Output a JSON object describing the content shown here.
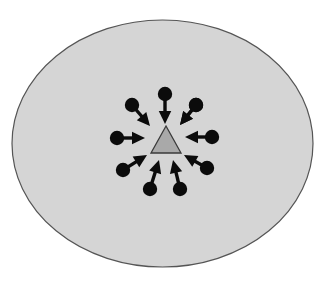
{
  "figure": {
    "background_color": "#ffffff",
    "width": 326,
    "height": 282
  },
  "ellipse": {
    "label": "enclosing-region",
    "cx": 162.5,
    "cy": 143.5,
    "rx": 150.5,
    "ry": 123.5,
    "fill": "#d5d5d5",
    "stroke": "#555555",
    "stroke_width": 1.2
  },
  "triangle": {
    "label": "center-target",
    "apex_x": 166,
    "apex_y": 126,
    "left_x": 151,
    "left_y": 153,
    "right_x": 181,
    "right_y": 153,
    "fill": "#a9a9a9",
    "stroke": "#3a3a3a",
    "stroke_width": 1.3
  },
  "arrows": {
    "count": 10,
    "color": "#0b0b0b",
    "dot_radius": 7.2,
    "shaft_width": 3.4,
    "head_length": 13,
    "head_width": 12.5,
    "center_x": 166,
    "center_y": 141,
    "items": [
      {
        "name": "arrow-n",
        "direction": "down",
        "angle_deg": 90,
        "tail_x": 165,
        "tail_y": 94,
        "tip_x": 165,
        "tip_y": 124
      },
      {
        "name": "arrow-nne",
        "direction": "down-left",
        "angle_deg": 126,
        "tail_x": 196,
        "tail_y": 105,
        "tip_x": 180,
        "tip_y": 125
      },
      {
        "name": "arrow-ene",
        "direction": "left",
        "angle_deg": 180,
        "tail_x": 212,
        "tail_y": 137,
        "tip_x": 185,
        "tip_y": 137
      },
      {
        "name": "arrow-ese",
        "direction": "up-left",
        "angle_deg": 230,
        "tail_x": 207,
        "tail_y": 168,
        "tip_x": 184,
        "tip_y": 155
      },
      {
        "name": "arrow-sse",
        "direction": "up-left",
        "angle_deg": 255,
        "tail_x": 180,
        "tail_y": 189,
        "tip_x": 173,
        "tip_y": 160
      },
      {
        "name": "arrow-ssw",
        "direction": "up-right",
        "angle_deg": 285,
        "tail_x": 150,
        "tail_y": 189,
        "tip_x": 159,
        "tip_y": 160
      },
      {
        "name": "arrow-wsw",
        "direction": "up-right",
        "angle_deg": 310,
        "tail_x": 123,
        "tail_y": 170,
        "tip_x": 147,
        "tip_y": 155
      },
      {
        "name": "arrow-w",
        "direction": "right",
        "angle_deg": 0,
        "tail_x": 117,
        "tail_y": 138,
        "tip_x": 145,
        "tip_y": 138
      },
      {
        "name": "arrow-wnw",
        "direction": "down-right",
        "angle_deg": 52,
        "tail_x": 132,
        "tail_y": 105,
        "tip_x": 150,
        "tip_y": 126
      },
      {
        "name": "arrow-nnw",
        "direction": "down-left",
        "angle_deg": 120,
        "tail_x": 196,
        "tail_y": 105,
        "tip_x": 180,
        "tip_y": 125
      }
    ]
  }
}
